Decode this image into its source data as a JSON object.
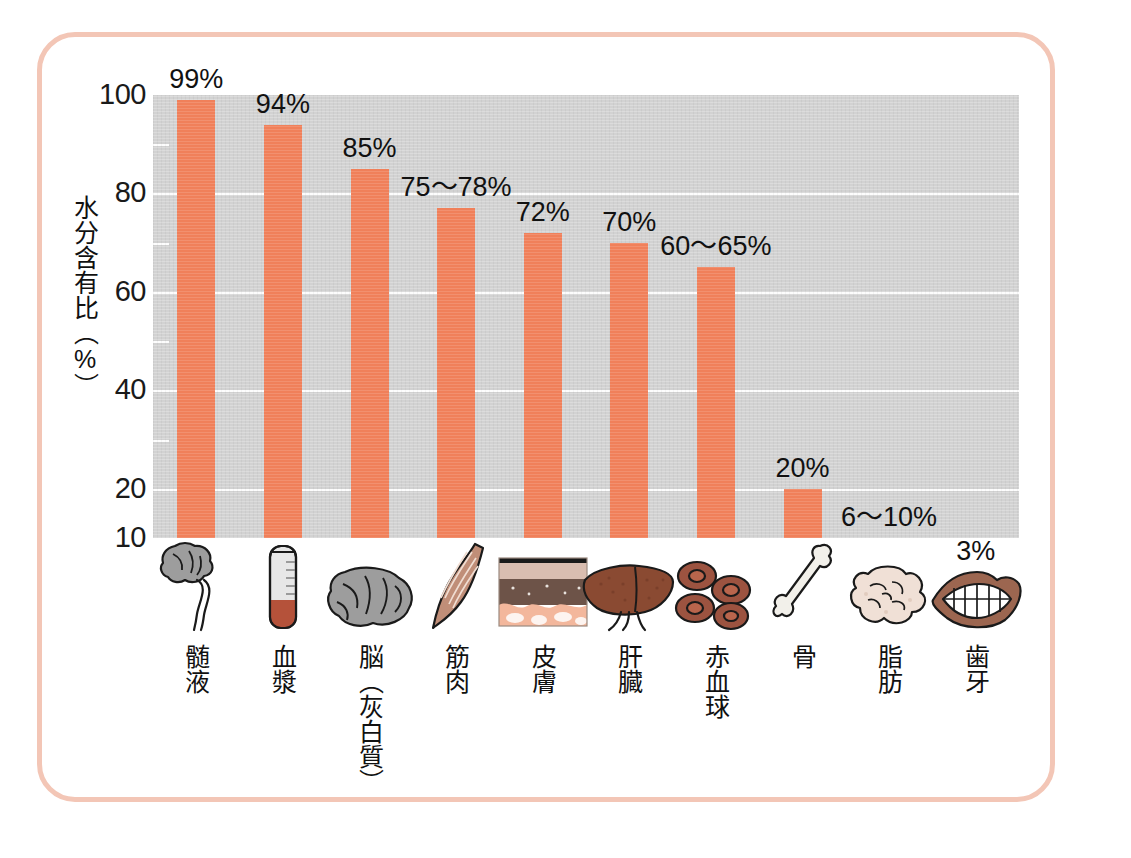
{
  "chart_data": {
    "type": "bar",
    "title": "",
    "xlabel": "",
    "ylabel": "水分含有比（%）",
    "ylim": [
      10,
      100
    ],
    "yticks": [
      100,
      80,
      60,
      40,
      20,
      10
    ],
    "minor_yticks": [
      90,
      70,
      50,
      30
    ],
    "grid": true,
    "legend": "none",
    "categories": [
      "髄液",
      "血漿",
      "脳（灰白質）",
      "筋肉",
      "皮膚",
      "肝臓",
      "赤血球",
      "骨",
      "脂肪",
      "歯牙"
    ],
    "values": [
      99,
      94,
      85,
      77,
      72,
      70,
      65,
      20,
      10,
      3
    ],
    "value_labels": [
      "99%",
      "94%",
      "85%",
      "75〜78%",
      "72%",
      "70%",
      "60〜65%",
      "20%",
      "6〜10%",
      "3%"
    ],
    "bar_color": "#f0805a",
    "plot_background": "#d2d2d2",
    "gridline_color": "#ffffff",
    "frame_color": "#f3c6b6"
  },
  "axis": {
    "y_title": "水分含有比（%）",
    "ticks": [
      {
        "label": "100",
        "value": 100
      },
      {
        "label": "80",
        "value": 80
      },
      {
        "label": "60",
        "value": 60
      },
      {
        "label": "40",
        "value": 40
      },
      {
        "label": "20",
        "value": 20
      },
      {
        "label": "10",
        "value": 10
      }
    ]
  },
  "bars": [
    {
      "label": "髄液",
      "value": 99,
      "value_label": "99%",
      "icon": "brain-spinal-cord-icon"
    },
    {
      "label": "血漿",
      "value": 94,
      "value_label": "94%",
      "icon": "test-tube-icon"
    },
    {
      "label": "脳（灰白質）",
      "value": 85,
      "value_label": "85%",
      "icon": "brain-icon"
    },
    {
      "label": "筋肉",
      "value": 77,
      "value_label": "75〜78%",
      "icon": "muscle-icon"
    },
    {
      "label": "皮膚",
      "value": 72,
      "value_label": "72%",
      "icon": "skin-cross-section-icon"
    },
    {
      "label": "肝臓",
      "value": 70,
      "value_label": "70%",
      "icon": "liver-icon"
    },
    {
      "label": "赤血球",
      "value": 65,
      "value_label": "60〜65%",
      "icon": "red-blood-cells-icon"
    },
    {
      "label": "骨",
      "value": 20,
      "value_label": "20%",
      "icon": "bone-icon"
    },
    {
      "label": "脂肪",
      "value": 10,
      "value_label": "6〜10%",
      "icon": "fat-tissue-icon"
    },
    {
      "label": "歯牙",
      "value": 3,
      "value_label": "3%",
      "icon": "mouth-teeth-icon"
    }
  ]
}
